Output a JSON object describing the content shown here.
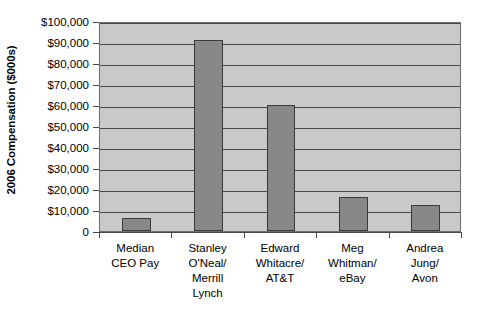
{
  "chart_data": {
    "type": "bar",
    "title": "",
    "xlabel": "",
    "ylabel": "2006 Compensation ($000s)",
    "ylim": [
      0,
      100000
    ],
    "ytick_step": 10000,
    "grid": true,
    "legend": "none",
    "categories": [
      "Median CEO Pay",
      "Stanley O'Neal/ Merrill Lynch",
      "Edward Whitacre/ AT&T",
      "Meg Whitman/ eBay",
      "Andrea Jung/ Avon"
    ],
    "category_lines": [
      [
        "Median",
        "CEO Pay"
      ],
      [
        "Stanley",
        "O'Neal/",
        "Merrill",
        "Lynch"
      ],
      [
        "Edward",
        "Whitacre/",
        "AT&T"
      ],
      [
        "Meg",
        "Whitman/",
        "eBay"
      ],
      [
        "Andrea",
        "Jung/",
        "Avon"
      ]
    ],
    "values": [
      6000,
      91000,
      60000,
      16000,
      12500
    ],
    "ytick_labels": [
      "$100,000",
      "$90,000",
      "$80,000",
      "$70,000",
      "$60,000",
      "$50,000",
      "$40,000",
      "$30,000",
      "$20,000",
      "$10,000",
      "0"
    ],
    "ytick_values": [
      100000,
      90000,
      80000,
      70000,
      60000,
      50000,
      40000,
      30000,
      20000,
      10000,
      0
    ],
    "colors": {
      "bar_fill": "#888888",
      "bar_outline": "#3a3a3a",
      "plot_background": "#c9c9c9",
      "gridline": "#4a4a4a",
      "axis": "#4a4a4a",
      "text": "#000000",
      "page_background": "#ffffff"
    }
  }
}
